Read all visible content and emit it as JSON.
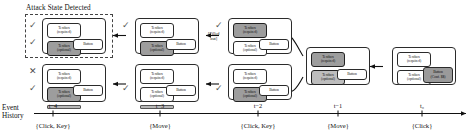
{
  "figure": {
    "attack_label": "Attack State Detected",
    "annotation": {
      "line1": "[Filled",
      "line2": "out]"
    },
    "timeline_label": {
      "line1": "Event",
      "line2": "History"
    }
  },
  "labels": {
    "textbox_required_l1": "Textbox",
    "textbox_required_l2": "(required)",
    "textbox_optional_l1": "Textbox",
    "textbox_optional_l2": "(optional)",
    "button": "Button",
    "button_conf_l1": "Button",
    "button_conf_l2": "(Conf. $$)",
    "check": "✓",
    "cross": "✕"
  },
  "timeline": {
    "ticks": [
      {
        "id": "t-4",
        "time": "t−4",
        "event": "{Click, Key}"
      },
      {
        "id": "t-3",
        "time": "t−3",
        "event": "{Move}"
      },
      {
        "id": "t-2",
        "time": "t−2",
        "event": "{Click, Key}"
      },
      {
        "id": "t-1",
        "time": "t−1",
        "event": "{Move}"
      },
      {
        "id": "t-0",
        "time": "t₀",
        "event": "{Click}"
      }
    ]
  },
  "nodes": [
    {
      "id": "n-t4-top",
      "column": "t-4",
      "row": "top",
      "required_state": "normal",
      "optional_state": "shaded",
      "has_bar": false,
      "button_state": "normal",
      "marks": [
        "check",
        "check"
      ],
      "in_attack_box": true
    },
    {
      "id": "n-t4-bottom",
      "column": "t-4",
      "row": "bottom",
      "required_state": "normal",
      "optional_state": "shaded",
      "has_bar": true,
      "button_state": "normal",
      "marks": [
        "cross",
        "check"
      ],
      "in_attack_box": false
    },
    {
      "id": "n-t3-top",
      "column": "t-3",
      "row": "top",
      "required_state": "normal",
      "optional_state": "shaded",
      "has_bar": false,
      "button_state": "normal",
      "marks": [
        "check"
      ],
      "in_attack_box": false
    },
    {
      "id": "n-t3-bottom",
      "column": "t-3",
      "row": "bottom",
      "required_state": "normal",
      "optional_state": "normal",
      "has_bar": true,
      "button_state": "normal",
      "marks": [
        "check"
      ],
      "in_attack_box": false
    },
    {
      "id": "n-t2-top",
      "column": "t-2",
      "row": "top",
      "required_state": "shaded",
      "optional_state": "normal",
      "has_bar": false,
      "button_state": "normal",
      "marks": [
        "check"
      ],
      "in_attack_box": false
    },
    {
      "id": "n-t2-bottom",
      "column": "t-2",
      "row": "bottom",
      "required_state": "normal",
      "optional_state": "shaded",
      "has_bar": false,
      "button_state": "normal",
      "marks": [
        "check"
      ],
      "in_attack_box": false
    },
    {
      "id": "n-t1",
      "column": "t-1",
      "row": "middle",
      "required_state": "shaded",
      "optional_state": "shaded2",
      "has_bar": false,
      "button_state": "normal",
      "marks": [],
      "in_attack_box": false
    },
    {
      "id": "n-t0",
      "column": "t-0",
      "row": "middle",
      "required_state": "normal",
      "optional_state": "normal",
      "has_bar": false,
      "button_state": "shaded",
      "marks": [],
      "in_attack_box": false
    }
  ]
}
